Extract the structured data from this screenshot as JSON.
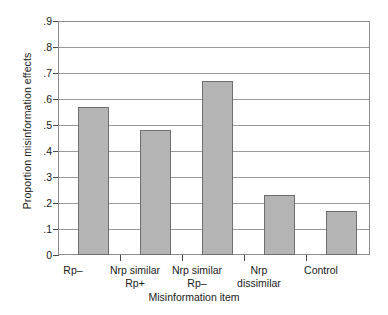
{
  "chart_data": {
    "type": "bar",
    "title": "",
    "xlabel": "Misinformation item",
    "ylabel": "Proportion misinformation effects",
    "categories": [
      "Rp–",
      "Nrp similar Rp+",
      "Nrp similar Rp–",
      "Nrp dissimilar",
      "Control"
    ],
    "category_lines": [
      {
        "line1": "Rp–",
        "line2": ""
      },
      {
        "line1": "Nrp similar",
        "line2": "Rp+"
      },
      {
        "line1": "Nrp similar",
        "line2": "Rp–"
      },
      {
        "line1": "Nrp",
        "line2": "dissimilar"
      },
      {
        "line1": "Control",
        "line2": ""
      }
    ],
    "values": [
      0.57,
      0.48,
      0.67,
      0.23,
      0.17
    ],
    "ylim": [
      0,
      0.9
    ],
    "ytick_values": [
      0.9,
      0.8,
      0.7,
      0.6,
      0.5,
      0.4,
      0.3,
      0.2,
      0.1,
      0
    ],
    "ytick_labels": [
      ".9",
      ".8",
      ".7",
      ".6",
      ".5",
      ".4",
      ".3",
      ".2",
      ".1",
      "0"
    ],
    "grid": true,
    "legend": "none",
    "bar_color": "#b4b4b4",
    "bar_border_color": "#6e6e6e",
    "axis_color": "#8c8c8c",
    "grid_color": "#9a9a9a"
  }
}
